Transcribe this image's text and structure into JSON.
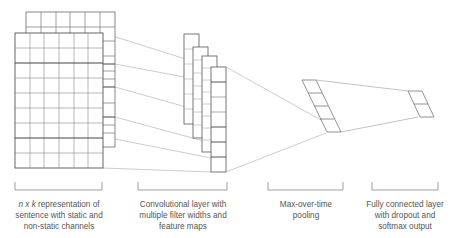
{
  "diagram": {
    "type": "cnn-architecture",
    "colors": {
      "stroke_dark": "#555555",
      "stroke_light": "#aaaaaa",
      "connector": "#999999",
      "text": "#555555",
      "background": "#ffffff"
    },
    "stages": [
      {
        "id": "input",
        "caption_italic": "n x k",
        "caption_lines": [
          " representation of",
          "sentence with static and",
          "non-static channels"
        ]
      },
      {
        "id": "conv",
        "caption_lines": [
          "Convolutional layer with",
          "multiple filter widths and",
          "feature maps"
        ]
      },
      {
        "id": "pool",
        "caption_lines": [
          "Max-over-time",
          "pooling"
        ]
      },
      {
        "id": "fc",
        "caption_lines": [
          "Fully connected layer",
          "with dropout and",
          "softmax output"
        ]
      }
    ],
    "input_matrix": {
      "channels": 2,
      "columns": 6,
      "rows": 9
    },
    "feature_maps": 4,
    "pooled_units": 4,
    "output_units": 2
  }
}
